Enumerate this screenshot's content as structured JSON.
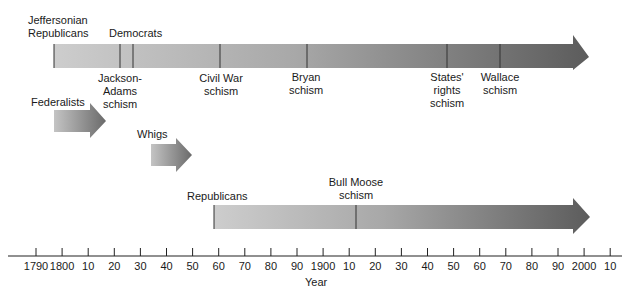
{
  "chart_data": {
    "type": "timeline",
    "title": "",
    "xlabel": "Year",
    "xlim": [
      1780,
      2015
    ],
    "x_tick_values": [
      1790,
      1800,
      1810,
      1820,
      1830,
      1840,
      1850,
      1860,
      1870,
      1880,
      1890,
      1900,
      1910,
      1920,
      1930,
      1940,
      1950,
      1960,
      1970,
      1980,
      1990,
      2000,
      2010
    ],
    "x_tick_labels": [
      "1790",
      "1800",
      "10",
      "20",
      "30",
      "40",
      "50",
      "60",
      "70",
      "80",
      "90",
      "1900",
      "10",
      "20",
      "30",
      "40",
      "50",
      "60",
      "70",
      "80",
      "90",
      "2000",
      "10"
    ],
    "series": [
      {
        "name": "Jeffersonian Republicans / Democrats",
        "label_lines": [
          "Jeffersonian",
          "Republicans"
        ],
        "secondary_label": "Democrats",
        "start": 1797,
        "end": "continuing",
        "events": [
          {
            "name": "Jackson-Adams schism",
            "year": 1822,
            "label_lines": [
              "Jackson-",
              "Adams",
              "schism"
            ]
          },
          {
            "name": "Jackson-Adams schism (end)",
            "year": 1828
          },
          {
            "name": "Civil War schism",
            "year": 1860,
            "label_lines": [
              "Civil War",
              "schism"
            ]
          },
          {
            "name": "Bryan schism",
            "year": 1896,
            "label_lines": [
              "Bryan",
              "schism"
            ]
          },
          {
            "name": "States' rights schism",
            "year": 1948,
            "label_lines": [
              "States'",
              "rights",
              "schism"
            ]
          },
          {
            "name": "Wallace schism",
            "year": 1968,
            "label_lines": [
              "Wallace",
              "schism"
            ]
          }
        ]
      },
      {
        "name": "Federalists",
        "label_lines": [
          "Federalists"
        ],
        "start": 1797,
        "end": 1816,
        "events": []
      },
      {
        "name": "Whigs",
        "label_lines": [
          "Whigs"
        ],
        "start": 1834,
        "end": 1854,
        "events": []
      },
      {
        "name": "Republicans",
        "label_lines": [
          "Republicans"
        ],
        "start": 1856,
        "end": "continuing",
        "events": [
          {
            "name": "Bull Moose schism",
            "year": 1912,
            "label_lines": [
              "Bull Moose",
              "schism"
            ]
          }
        ]
      }
    ],
    "grid": false,
    "legend": "none"
  },
  "axis": {
    "label": "Year"
  },
  "colors": {
    "bar_light": "#c8c8c8",
    "bar_dark": "#5a5a5a",
    "line": "#222222"
  }
}
